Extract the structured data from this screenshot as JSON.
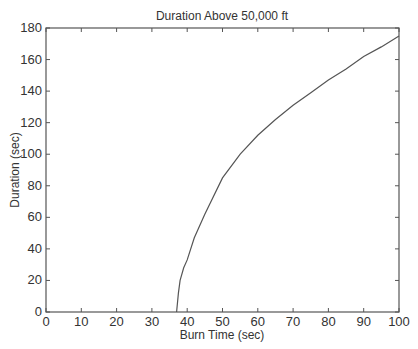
{
  "chart_data": {
    "type": "line",
    "title": "Duration Above 50,000 ft",
    "xlabel": "Burn Time (sec)",
    "ylabel": "Duration (sec)",
    "xlim": [
      0,
      100
    ],
    "ylim": [
      0,
      180
    ],
    "xticks": [
      0,
      10,
      20,
      30,
      40,
      50,
      60,
      70,
      80,
      90,
      100
    ],
    "yticks": [
      0,
      20,
      40,
      60,
      80,
      100,
      120,
      140,
      160,
      180
    ],
    "grid": false,
    "legend": null,
    "series": [
      {
        "name": "Duration",
        "color": "#555555",
        "x": [
          37,
          37.5,
          38,
          39,
          40,
          42,
          45,
          50,
          55,
          60,
          65,
          70,
          75,
          80,
          85,
          90,
          95,
          100
        ],
        "y": [
          0,
          12,
          20,
          28,
          33,
          47,
          62,
          85,
          100,
          112,
          122,
          131,
          139,
          147,
          154,
          162,
          168,
          175
        ]
      }
    ]
  }
}
